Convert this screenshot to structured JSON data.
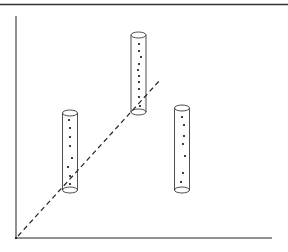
{
  "diagram": {
    "colors": {
      "stroke": "#222222",
      "dot": "#111111",
      "background": "#ffffff",
      "top_border": "#333333"
    },
    "axes": {
      "origin": [
        16,
        238
      ],
      "y_axis_top": 16,
      "x_axis_right": 272
    },
    "trend_line": {
      "style": "dashed",
      "from": [
        18,
        236
      ],
      "to": [
        161,
        79
      ]
    },
    "cylinders": [
      {
        "name": "cylinder-left",
        "cx": 70,
        "rx": 7.5,
        "ry": 3,
        "top_y": 113,
        "bottom_y": 190,
        "dots": [
          [
            69,
            120
          ],
          [
            70,
            128
          ],
          [
            70,
            137
          ],
          [
            70,
            146
          ],
          [
            72,
            158
          ],
          [
            68,
            167
          ],
          [
            70,
            176
          ],
          [
            70,
            184
          ]
        ]
      },
      {
        "name": "cylinder-middle",
        "cx": 138.5,
        "rx": 7.5,
        "ry": 3,
        "top_y": 35,
        "bottom_y": 112,
        "dots": [
          [
            139,
            44
          ],
          [
            139,
            51
          ],
          [
            141,
            57
          ],
          [
            139,
            64
          ],
          [
            138,
            70
          ],
          [
            139,
            76
          ],
          [
            139,
            82
          ],
          [
            139,
            89
          ],
          [
            139,
            97
          ],
          [
            140,
            106
          ]
        ]
      },
      {
        "name": "cylinder-right",
        "cx": 182,
        "rx": 7.5,
        "ry": 3,
        "top_y": 108,
        "bottom_y": 190,
        "dots": [
          [
            182,
            117
          ],
          [
            184,
            125
          ],
          [
            184,
            136
          ],
          [
            183,
            144
          ],
          [
            185,
            156
          ],
          [
            183,
            173
          ],
          [
            181,
            182
          ]
        ]
      }
    ]
  }
}
